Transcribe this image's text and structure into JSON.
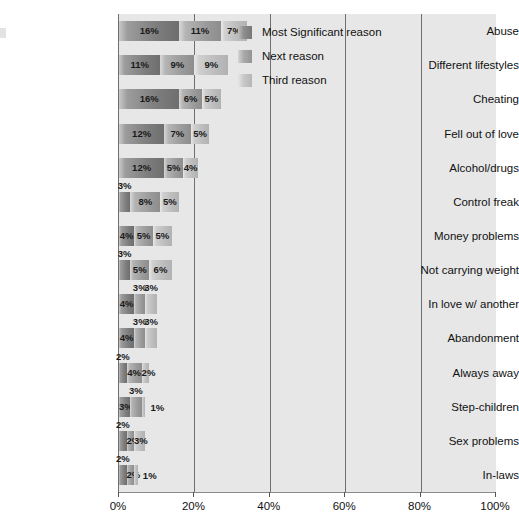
{
  "chart_data": {
    "type": "bar",
    "subtype": "stacked-horizontal",
    "title": "",
    "xlabel": "",
    "ylabel": "",
    "xlim": [
      0,
      100
    ],
    "xticks": [
      "0%",
      "20%",
      "40%",
      "60%",
      "80%",
      "100%"
    ],
    "xtick_values": [
      0,
      20,
      40,
      60,
      80,
      100
    ],
    "grid": true,
    "gridlines_at": [
      20,
      40,
      60,
      80
    ],
    "legend_position": "top-right",
    "categories": [
      "Abuse",
      "Different lifestyles",
      "Cheating",
      "Fell out of love",
      "Alcohol/drugs",
      "Control freak",
      "Money problems",
      "Not carrying weight",
      "In love w/ another",
      "Abandonment",
      "Always away",
      "Step-children",
      "Sex problems",
      "In-laws"
    ],
    "series": [
      {
        "name": "Most Significant reason",
        "color": "#7e7e7e",
        "values": [
          16,
          11,
          16,
          12,
          12,
          3,
          4,
          3,
          4,
          4,
          2,
          3,
          2,
          2
        ],
        "labels": [
          "16%",
          "11%",
          "16%",
          "12%",
          "12%",
          "3%",
          "4%",
          "3%",
          "4%",
          "4%",
          "2%",
          "3%",
          "2%",
          "2%"
        ]
      },
      {
        "name": "Next reason",
        "color": "#9b9b9b",
        "values": [
          11,
          9,
          6,
          7,
          5,
          8,
          5,
          5,
          3,
          3,
          4,
          3,
          2,
          2
        ],
        "labels": [
          "11%",
          "9%",
          "6%",
          "7%",
          "5%",
          "8%",
          "5%",
          "5%",
          "3%",
          "3%",
          "4%",
          "3%",
          "2%",
          "2%"
        ]
      },
      {
        "name": "Third reason",
        "color": "#bcbcbc",
        "values": [
          7,
          9,
          5,
          5,
          4,
          5,
          5,
          6,
          3,
          3,
          2,
          1,
          3,
          1
        ],
        "labels": [
          "7%",
          "9%",
          "5%",
          "5%",
          "4%",
          "5%",
          "5%",
          "6%",
          "3%",
          "3%",
          "2%",
          "1%",
          "3%",
          "1%"
        ]
      }
    ],
    "label_placement": [
      [
        "in",
        "in",
        "in"
      ],
      [
        "in",
        "in",
        "in"
      ],
      [
        "in",
        "in",
        "in"
      ],
      [
        "in",
        "in",
        "in"
      ],
      [
        "in",
        "in",
        "in"
      ],
      [
        "top",
        "in",
        "in"
      ],
      [
        "in",
        "in",
        "in"
      ],
      [
        "top",
        "in",
        "in"
      ],
      [
        "in",
        "top",
        "top"
      ],
      [
        "in",
        "top",
        "top"
      ],
      [
        "top",
        "in",
        "in"
      ],
      [
        "in",
        "top",
        "right"
      ],
      [
        "top",
        "in",
        "in"
      ],
      [
        "top",
        "in",
        "right"
      ]
    ]
  },
  "legend": {
    "items": [
      {
        "label": "Most Significant reason",
        "swatch": "series-0-swatch"
      },
      {
        "label": "Next reason",
        "swatch": "series-1-swatch"
      },
      {
        "label": "Third reason",
        "swatch": "series-2-swatch"
      }
    ]
  },
  "colors": {
    "plot_background": "#e7e7e7",
    "gridline": "#6f6f6f",
    "axis": "#8a8a8a",
    "text": "#111111",
    "series_0": "#7e7e7e",
    "series_1": "#9b9b9b",
    "series_2": "#bcbcbc"
  }
}
